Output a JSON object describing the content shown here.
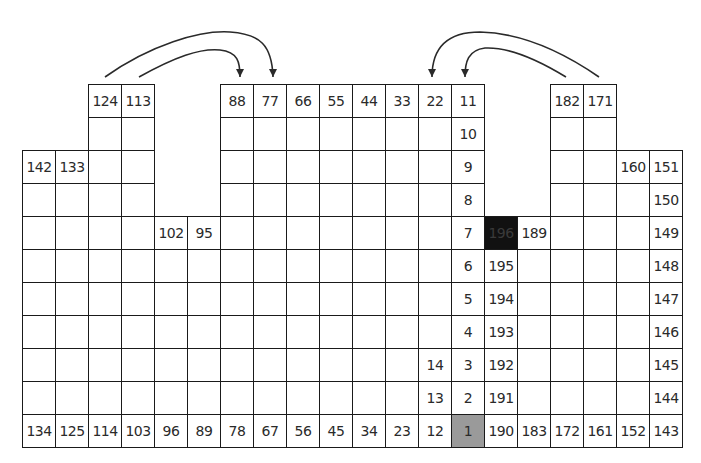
{
  "diagram": {
    "type": "numbered-grid-path",
    "grid": {
      "origin_x": 22,
      "origin_y": 84,
      "cell_size": 33,
      "columns": 20,
      "rows": 11
    },
    "colors": {
      "line": "#1a1a1a",
      "start_cell": "#9a9a9a",
      "end_cell": "#111111",
      "background": "#ffffff"
    },
    "start_cell_label": "1",
    "end_cell_label": "196",
    "rows": [
      {
        "row": 0,
        "cells": [
          {
            "col": 2,
            "label": "124"
          },
          {
            "col": 3,
            "label": "113"
          },
          {
            "col": 6,
            "label": "88"
          },
          {
            "col": 7,
            "label": "77"
          },
          {
            "col": 8,
            "label": "66"
          },
          {
            "col": 9,
            "label": "55"
          },
          {
            "col": 10,
            "label": "44"
          },
          {
            "col": 11,
            "label": "33"
          },
          {
            "col": 12,
            "label": "22"
          },
          {
            "col": 13,
            "label": "11"
          },
          {
            "col": 16,
            "label": "182"
          },
          {
            "col": 17,
            "label": "171"
          }
        ]
      },
      {
        "row": 1,
        "cells": [
          {
            "col": 2,
            "label": ""
          },
          {
            "col": 3,
            "label": ""
          },
          {
            "col": 6,
            "label": ""
          },
          {
            "col": 7,
            "label": ""
          },
          {
            "col": 8,
            "label": ""
          },
          {
            "col": 9,
            "label": ""
          },
          {
            "col": 10,
            "label": ""
          },
          {
            "col": 11,
            "label": ""
          },
          {
            "col": 12,
            "label": ""
          },
          {
            "col": 13,
            "label": "10"
          },
          {
            "col": 16,
            "label": ""
          },
          {
            "col": 17,
            "label": ""
          }
        ]
      },
      {
        "row": 2,
        "cells": [
          {
            "col": 0,
            "label": "142"
          },
          {
            "col": 1,
            "label": "133"
          },
          {
            "col": 2,
            "label": ""
          },
          {
            "col": 3,
            "label": ""
          },
          {
            "col": 6,
            "label": ""
          },
          {
            "col": 7,
            "label": ""
          },
          {
            "col": 8,
            "label": ""
          },
          {
            "col": 9,
            "label": ""
          },
          {
            "col": 10,
            "label": ""
          },
          {
            "col": 11,
            "label": ""
          },
          {
            "col": 12,
            "label": ""
          },
          {
            "col": 13,
            "label": "9"
          },
          {
            "col": 16,
            "label": ""
          },
          {
            "col": 17,
            "label": ""
          },
          {
            "col": 18,
            "label": "160"
          },
          {
            "col": 19,
            "label": "151"
          }
        ]
      },
      {
        "row": 3,
        "cells": [
          {
            "col": 0,
            "label": ""
          },
          {
            "col": 1,
            "label": ""
          },
          {
            "col": 2,
            "label": ""
          },
          {
            "col": 3,
            "label": ""
          },
          {
            "col": 6,
            "label": ""
          },
          {
            "col": 7,
            "label": ""
          },
          {
            "col": 8,
            "label": ""
          },
          {
            "col": 9,
            "label": ""
          },
          {
            "col": 10,
            "label": ""
          },
          {
            "col": 11,
            "label": ""
          },
          {
            "col": 12,
            "label": ""
          },
          {
            "col": 13,
            "label": "8"
          },
          {
            "col": 16,
            "label": ""
          },
          {
            "col": 17,
            "label": ""
          },
          {
            "col": 18,
            "label": ""
          },
          {
            "col": 19,
            "label": "150"
          }
        ]
      },
      {
        "row": 4,
        "cells": [
          {
            "col": 0,
            "label": ""
          },
          {
            "col": 1,
            "label": ""
          },
          {
            "col": 2,
            "label": ""
          },
          {
            "col": 3,
            "label": ""
          },
          {
            "col": 4,
            "label": "102"
          },
          {
            "col": 5,
            "label": "95"
          },
          {
            "col": 6,
            "label": ""
          },
          {
            "col": 7,
            "label": ""
          },
          {
            "col": 8,
            "label": ""
          },
          {
            "col": 9,
            "label": ""
          },
          {
            "col": 10,
            "label": ""
          },
          {
            "col": 11,
            "label": ""
          },
          {
            "col": 12,
            "label": ""
          },
          {
            "col": 13,
            "label": "7"
          },
          {
            "col": 14,
            "label": "196",
            "style": "black"
          },
          {
            "col": 15,
            "label": "189"
          },
          {
            "col": 16,
            "label": ""
          },
          {
            "col": 17,
            "label": ""
          },
          {
            "col": 18,
            "label": ""
          },
          {
            "col": 19,
            "label": "149"
          }
        ]
      },
      {
        "row": 5,
        "cells": [
          {
            "col": 0,
            "label": ""
          },
          {
            "col": 1,
            "label": ""
          },
          {
            "col": 2,
            "label": ""
          },
          {
            "col": 3,
            "label": ""
          },
          {
            "col": 4,
            "label": ""
          },
          {
            "col": 5,
            "label": ""
          },
          {
            "col": 6,
            "label": ""
          },
          {
            "col": 7,
            "label": ""
          },
          {
            "col": 8,
            "label": ""
          },
          {
            "col": 9,
            "label": ""
          },
          {
            "col": 10,
            "label": ""
          },
          {
            "col": 11,
            "label": ""
          },
          {
            "col": 12,
            "label": ""
          },
          {
            "col": 13,
            "label": "6"
          },
          {
            "col": 14,
            "label": "195"
          },
          {
            "col": 15,
            "label": ""
          },
          {
            "col": 16,
            "label": ""
          },
          {
            "col": 17,
            "label": ""
          },
          {
            "col": 18,
            "label": ""
          },
          {
            "col": 19,
            "label": "148"
          }
        ]
      },
      {
        "row": 6,
        "cells": [
          {
            "col": 0,
            "label": ""
          },
          {
            "col": 1,
            "label": ""
          },
          {
            "col": 2,
            "label": ""
          },
          {
            "col": 3,
            "label": ""
          },
          {
            "col": 4,
            "label": ""
          },
          {
            "col": 5,
            "label": ""
          },
          {
            "col": 6,
            "label": ""
          },
          {
            "col": 7,
            "label": ""
          },
          {
            "col": 8,
            "label": ""
          },
          {
            "col": 9,
            "label": ""
          },
          {
            "col": 10,
            "label": ""
          },
          {
            "col": 11,
            "label": ""
          },
          {
            "col": 12,
            "label": ""
          },
          {
            "col": 13,
            "label": "5"
          },
          {
            "col": 14,
            "label": "194"
          },
          {
            "col": 15,
            "label": ""
          },
          {
            "col": 16,
            "label": ""
          },
          {
            "col": 17,
            "label": ""
          },
          {
            "col": 18,
            "label": ""
          },
          {
            "col": 19,
            "label": "147"
          }
        ]
      },
      {
        "row": 7,
        "cells": [
          {
            "col": 0,
            "label": ""
          },
          {
            "col": 1,
            "label": ""
          },
          {
            "col": 2,
            "label": ""
          },
          {
            "col": 3,
            "label": ""
          },
          {
            "col": 4,
            "label": ""
          },
          {
            "col": 5,
            "label": ""
          },
          {
            "col": 6,
            "label": ""
          },
          {
            "col": 7,
            "label": ""
          },
          {
            "col": 8,
            "label": ""
          },
          {
            "col": 9,
            "label": ""
          },
          {
            "col": 10,
            "label": ""
          },
          {
            "col": 11,
            "label": ""
          },
          {
            "col": 12,
            "label": ""
          },
          {
            "col": 13,
            "label": "4"
          },
          {
            "col": 14,
            "label": "193"
          },
          {
            "col": 15,
            "label": ""
          },
          {
            "col": 16,
            "label": ""
          },
          {
            "col": 17,
            "label": ""
          },
          {
            "col": 18,
            "label": ""
          },
          {
            "col": 19,
            "label": "146"
          }
        ]
      },
      {
        "row": 8,
        "cells": [
          {
            "col": 0,
            "label": ""
          },
          {
            "col": 1,
            "label": ""
          },
          {
            "col": 2,
            "label": ""
          },
          {
            "col": 3,
            "label": ""
          },
          {
            "col": 4,
            "label": ""
          },
          {
            "col": 5,
            "label": ""
          },
          {
            "col": 6,
            "label": ""
          },
          {
            "col": 7,
            "label": ""
          },
          {
            "col": 8,
            "label": ""
          },
          {
            "col": 9,
            "label": ""
          },
          {
            "col": 10,
            "label": ""
          },
          {
            "col": 11,
            "label": ""
          },
          {
            "col": 12,
            "label": "14"
          },
          {
            "col": 13,
            "label": "3"
          },
          {
            "col": 14,
            "label": "192"
          },
          {
            "col": 15,
            "label": ""
          },
          {
            "col": 16,
            "label": ""
          },
          {
            "col": 17,
            "label": ""
          },
          {
            "col": 18,
            "label": ""
          },
          {
            "col": 19,
            "label": "145"
          }
        ]
      },
      {
        "row": 9,
        "cells": [
          {
            "col": 0,
            "label": ""
          },
          {
            "col": 1,
            "label": ""
          },
          {
            "col": 2,
            "label": ""
          },
          {
            "col": 3,
            "label": ""
          },
          {
            "col": 4,
            "label": ""
          },
          {
            "col": 5,
            "label": ""
          },
          {
            "col": 6,
            "label": ""
          },
          {
            "col": 7,
            "label": ""
          },
          {
            "col": 8,
            "label": ""
          },
          {
            "col": 9,
            "label": ""
          },
          {
            "col": 10,
            "label": ""
          },
          {
            "col": 11,
            "label": ""
          },
          {
            "col": 12,
            "label": "13"
          },
          {
            "col": 13,
            "label": "2"
          },
          {
            "col": 14,
            "label": "191"
          },
          {
            "col": 15,
            "label": ""
          },
          {
            "col": 16,
            "label": ""
          },
          {
            "col": 17,
            "label": ""
          },
          {
            "col": 18,
            "label": ""
          },
          {
            "col": 19,
            "label": "144"
          }
        ]
      },
      {
        "row": 10,
        "cells": [
          {
            "col": 0,
            "label": "134"
          },
          {
            "col": 1,
            "label": "125"
          },
          {
            "col": 2,
            "label": "114"
          },
          {
            "col": 3,
            "label": "103"
          },
          {
            "col": 4,
            "label": "96"
          },
          {
            "col": 5,
            "label": "89"
          },
          {
            "col": 6,
            "label": "78"
          },
          {
            "col": 7,
            "label": "67"
          },
          {
            "col": 8,
            "label": "56"
          },
          {
            "col": 9,
            "label": "45"
          },
          {
            "col": 10,
            "label": "34"
          },
          {
            "col": 11,
            "label": "23"
          },
          {
            "col": 12,
            "label": "12"
          },
          {
            "col": 13,
            "label": "1",
            "style": "gray"
          },
          {
            "col": 14,
            "label": "190"
          },
          {
            "col": 15,
            "label": "183"
          },
          {
            "col": 16,
            "label": "172"
          },
          {
            "col": 17,
            "label": "161"
          },
          {
            "col": 18,
            "label": "152"
          },
          {
            "col": 19,
            "label": "143"
          }
        ]
      }
    ],
    "arrows": [
      {
        "from_label": "124",
        "to_label": "77",
        "path": "M 105 77 C 150 45, 200 30, 230 32 C 260 34, 272 45, 273 77"
      },
      {
        "from_label": "113",
        "to_label": "88",
        "path": "M 139 77 C 175 57, 200 48, 220 50 C 238 52, 240 62, 240 77"
      },
      {
        "from_label": "182",
        "to_label": "11",
        "path": "M 566 77 C 530 55, 505 47, 485 48 C 468 50, 465 62, 465 77"
      },
      {
        "from_label": "171",
        "to_label": "22",
        "path": "M 599 77 C 560 50, 520 33, 480 32 C 445 32, 432 50, 432 77"
      }
    ]
  }
}
